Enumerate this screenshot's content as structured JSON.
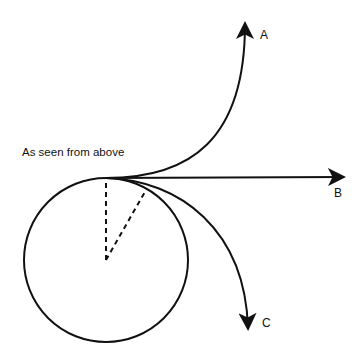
{
  "diagram": {
    "caption": "As seen from above",
    "labels": {
      "a": "A",
      "b": "B",
      "c": "C"
    },
    "stroke_color": "#111111"
  }
}
